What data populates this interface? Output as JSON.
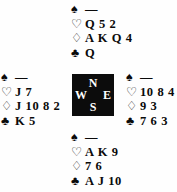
{
  "diagram": {
    "type": "bridge-hand-diagram",
    "suit_order": [
      "spades",
      "hearts",
      "diamonds",
      "clubs"
    ],
    "suit_symbols": {
      "spades": "♠",
      "hearts": "♡",
      "diamonds": "♢",
      "clubs": "♣"
    },
    "void_marker": "—",
    "compass": {
      "north": "N",
      "west": "W",
      "east": "E",
      "south": "S",
      "background_color": "#0c0c0c",
      "text_color": "#ffffff"
    },
    "hands": {
      "north": {
        "label": "N",
        "spades": "—",
        "hearts": "Q 5 2",
        "diamonds": "A K Q 4",
        "clubs": "Q"
      },
      "west": {
        "label": "W",
        "spades": "—",
        "hearts": "J 7",
        "diamonds": "J 10 8 2",
        "clubs": "K 5"
      },
      "east": {
        "label": "E",
        "spades": "—",
        "hearts": "10 8 4",
        "diamonds": "9 3",
        "clubs": "7 6 3"
      },
      "south": {
        "label": "S",
        "spades": "—",
        "hearts": "A K 9",
        "diamonds": "7 6",
        "clubs": "A J 10"
      }
    }
  }
}
